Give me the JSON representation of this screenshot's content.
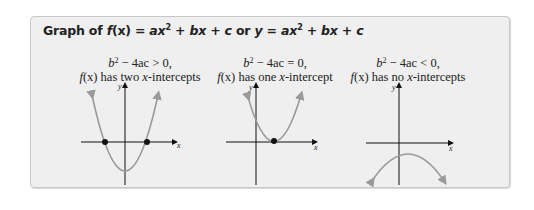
{
  "title": {
    "prefix": "Graph of ",
    "f": "f",
    "x_paren": "(x)",
    "eq1": " = ",
    "a1": "ax",
    "sup1": "2",
    "rest1": " + bx + c",
    "or": " or ",
    "y": "y",
    "eq2": " = ",
    "a2": "ax",
    "sup2": "2",
    "rest2": " + bx + c"
  },
  "panels": [
    {
      "condition_b": "b",
      "condition_sup": "2",
      "condition_rest": " − 4ac > 0,",
      "description_f": "f",
      "description_x": "(x)",
      "description_text": " has two ",
      "description_var": "x",
      "description_end": "-intercepts"
    },
    {
      "condition_b": "b",
      "condition_sup": "2",
      "condition_rest": " − 4ac = 0,",
      "description_f": "f",
      "description_x": "(x)",
      "description_text": " has one ",
      "description_var": "x",
      "description_end": "-intercept"
    },
    {
      "condition_b": "b",
      "condition_sup": "2",
      "condition_rest": " − 4ac < 0,",
      "description_f": "f",
      "description_x": "(x)",
      "description_text": " has no ",
      "description_var": "x",
      "description_end": "-intercepts"
    }
  ],
  "axis_labels": {
    "x": "x",
    "y": "y"
  },
  "colors": {
    "panel_bg": "#efefef",
    "panel_border": "#c8c8c8",
    "curve": "#9a9a9a",
    "axis": "#111111",
    "point": "#111111"
  }
}
